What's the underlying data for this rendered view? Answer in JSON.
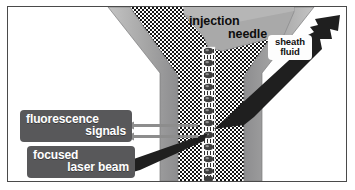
{
  "figure": {
    "background_color": "#ffffff",
    "frame_color": "#4a4a4a"
  },
  "labels": {
    "injection_needle": {
      "line1": "injection",
      "line2": "needle",
      "style": "plain-black-on-gray"
    },
    "sheath_fluid": {
      "line1": "sheath",
      "line2": "fluid",
      "style": "black-on-white-box"
    },
    "fluorescence_signals": {
      "line1": "fluorescence",
      "line2": "signals",
      "style": "white-on-dark-box"
    },
    "focused_laser_beam": {
      "line1": "focused",
      "line2": "laser beam",
      "style": "white-on-dark-box"
    }
  },
  "colors": {
    "label_box_dark": "#58585a",
    "label_text_light": "#ffffff",
    "label_box_white": "#fdfdfd",
    "label_text_dark": "#101010",
    "wall_gray": "#a7a7a7",
    "wall_gray_light": "#bcbcbc",
    "wall_gray_dark": "#8e8e90",
    "needle_gray": "#a9a9a9",
    "beam_black": "#1c1c1c",
    "arrow_gray": "#8d8d8d",
    "cell_dark": "#3a3a3a",
    "stipple_dark": "#141414",
    "stipple_light": "#ffffff"
  },
  "elements": {
    "flow_cell": "funnel-shaped flow chamber with stippled sheath fluid",
    "core_stream": "narrow central sample core with aligned cells",
    "cells": {
      "count": 12,
      "description": "dark ellipsoidal cells in single file along core stream"
    },
    "laser_beam": {
      "direction": "from lower-left to interrogation point",
      "description": "focused laser beam wedge"
    },
    "scatter_beam": {
      "direction": "to upper-right",
      "description": "scattered light wedge exiting flow cell"
    },
    "fluorescence_arrows": {
      "count": 2,
      "direction": "left",
      "description": "two horizontal arrows indicating emitted fluorescence"
    }
  }
}
